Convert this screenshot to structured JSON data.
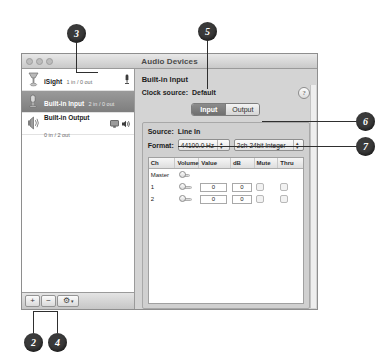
{
  "window": {
    "title": "Audio Devices",
    "traffic_lights": [
      "close-button",
      "minimize-button",
      "zoom-button"
    ]
  },
  "sidebar": {
    "devices": [
      {
        "name": "iSight",
        "channels": "1 in / 0 out",
        "selected": false,
        "icon": "isight-camera-icon",
        "badges": [
          "microphone-icon"
        ]
      },
      {
        "name": "Built-in Input",
        "channels": "2 in / 0 out",
        "selected": true,
        "icon": "microphone-icon",
        "badges": []
      },
      {
        "name": "Built-in Output",
        "channels": "0 in / 2 out",
        "selected": false,
        "icon": "speaker-device-icon",
        "badges": [
          "display-icon",
          "speaker-icon"
        ]
      }
    ],
    "toolbar": {
      "add_label": "+",
      "remove_label": "−",
      "action_label": "⚙",
      "action_arrow": "▾"
    }
  },
  "detail": {
    "device_heading": "Built-in Input",
    "clock_source_label": "Clock source:",
    "clock_source_value": "Default",
    "help_label": "?",
    "tabs": [
      {
        "label": "Input",
        "active": true
      },
      {
        "label": "Output",
        "active": false
      }
    ],
    "source_label": "Source:",
    "source_value": "Line In",
    "format_label": "Format:",
    "sample_rate": "44100.0 Hz",
    "bit_format": "2ch-24bit Integer",
    "channel_table": {
      "headers": [
        "Ch",
        "Volume",
        "Value",
        "dB",
        "Mute",
        "Thru"
      ],
      "rows": [
        {
          "ch": "Master",
          "value": "",
          "db": "",
          "has_fields": false,
          "mute": false,
          "thru": false
        },
        {
          "ch": "1",
          "value": "0",
          "db": "0",
          "has_fields": true,
          "mute": false,
          "thru": false
        },
        {
          "ch": "2",
          "value": "0",
          "db": "0",
          "has_fields": true,
          "mute": false,
          "thru": false
        }
      ]
    }
  },
  "callouts": [
    {
      "number": "2"
    },
    {
      "number": "3"
    },
    {
      "number": "4"
    },
    {
      "number": "5"
    },
    {
      "number": "6"
    },
    {
      "number": "7"
    }
  ]
}
